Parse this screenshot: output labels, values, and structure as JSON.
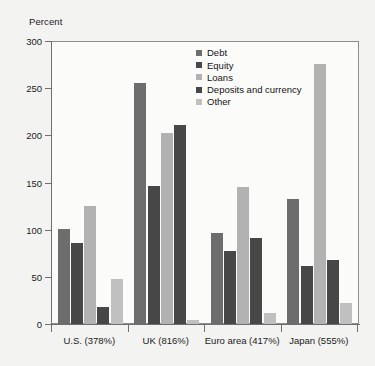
{
  "chart_data": {
    "type": "bar",
    "title": "",
    "subtitle": "",
    "xlabel": "",
    "ylabel": "Percent",
    "ylim": [
      0,
      300
    ],
    "yticks": [
      0,
      50,
      100,
      150,
      200,
      250,
      300
    ],
    "ytick_labels": [
      "0",
      "50",
      "100",
      "150",
      "200",
      "250",
      "300"
    ],
    "grid": false,
    "legend_position": "top-center-right",
    "categories": [
      "U.S. (378%)",
      "UK (816%)",
      "Euro area (417%)",
      "Japan (555%)"
    ],
    "series": [
      {
        "name": "Debt",
        "color": "#6d6d6d",
        "values": [
          101,
          255,
          96,
          133
        ]
      },
      {
        "name": "Equity",
        "color": "#474747",
        "values": [
          86,
          146,
          77,
          61
        ]
      },
      {
        "name": "Loans",
        "color": "#b2b2b2",
        "values": [
          125,
          203,
          145,
          276
        ]
      },
      {
        "name": "Deposits and currency",
        "color": "#474747",
        "values": [
          18,
          211,
          91,
          68
        ]
      },
      {
        "name": "Other",
        "color": "#c0c0c0",
        "values": [
          48,
          4,
          12,
          22
        ]
      }
    ]
  },
  "legend": {
    "items": [
      {
        "label": "Debt"
      },
      {
        "label": "Equity"
      },
      {
        "label": "Loans"
      },
      {
        "label": "Deposits and currency"
      },
      {
        "label": "Other"
      }
    ]
  },
  "colors": {
    "background": "#f3f3f1",
    "plot_background": "#fbfbfa",
    "axis": "#6f6f6f",
    "frame": "#8d8d8d",
    "text": "#1b1b1b"
  }
}
